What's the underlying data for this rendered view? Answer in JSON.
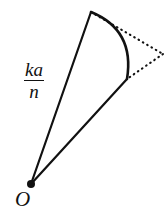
{
  "figure": {
    "kind": "geometric-diagram",
    "width": 168,
    "height": 221,
    "background_color": "#ffffff",
    "stroke_color": "#111111"
  },
  "labels": {
    "fraction": {
      "numerator": "ka",
      "denominator": "n"
    },
    "origin": "O"
  },
  "geometry": {
    "origin_point": {
      "x": 31,
      "y": 184,
      "dot_radius": 4
    },
    "arc_start_point": {
      "x": 91,
      "y": 12
    },
    "arc_end_point": {
      "x": 127,
      "y": 79
    },
    "arc_bulge_control": {
      "x": 135,
      "y": 30
    },
    "dotted_apex_point": {
      "x": 163,
      "y": 54
    },
    "solid_radius_lines": [
      {
        "from": "origin_point",
        "to": "arc_start_point"
      },
      {
        "from": "origin_point",
        "to": "arc_end_point"
      }
    ],
    "dotted_tangent_lines": [
      {
        "from": "arc_start_point",
        "to": "dotted_apex_point"
      },
      {
        "from": "dotted_apex_point",
        "to": "arc_end_point"
      }
    ],
    "stroke_widths": {
      "radius_line": 2.2,
      "arc": 2.6,
      "dotted": 2.1
    },
    "dash_pattern": "0.6 4.4"
  }
}
